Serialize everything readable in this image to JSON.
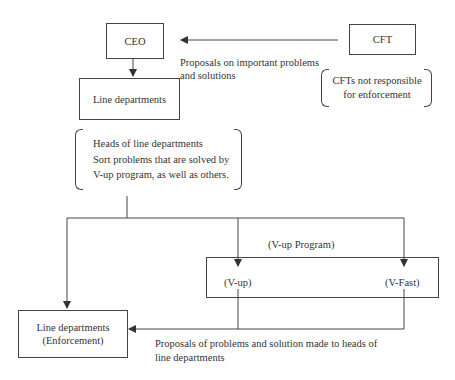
{
  "diagram": {
    "nodes": {
      "ceo": "CEO",
      "cft": "CFT",
      "line_departments": "Line departments",
      "v_up": "(V-up)",
      "v_fast": "(V-Fast)",
      "enforcement_line1": "Line departments",
      "enforcement_line2": "(Enforcement)"
    },
    "labels": {
      "cft_to_ceo_line1": "Proposals on important problems",
      "cft_to_ceo_line2": "and solutions",
      "v_up_program": "(V-up Program)",
      "bottom_caption_line1": "Proposals of problems and solution made to heads of",
      "bottom_caption_line2": "line departments"
    },
    "notes": {
      "cft_note_line1": "CFTs not responsible",
      "cft_note_line2": "for enforcement",
      "heads_line1": "Heads of line departments",
      "heads_line2": "Sort problems that are solved by",
      "heads_line3": "V-up program, as well as others."
    },
    "colors": {
      "line": "#444444",
      "text": "#333333",
      "background": "#ffffff"
    }
  }
}
